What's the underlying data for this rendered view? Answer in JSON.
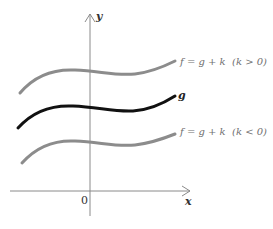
{
  "diagram": {
    "axes": {
      "x_label": "x",
      "y_label": "y",
      "origin_label": "0",
      "axis_color": "#8a8a8a"
    },
    "curves": [
      {
        "id": "upper",
        "label": "f = g + k  (k > 0)",
        "color": "#8c8c8c",
        "description": "g shifted up by k"
      },
      {
        "id": "base",
        "label": "g",
        "color": "#111111",
        "description": "original function g"
      },
      {
        "id": "lower",
        "label": "f = g + k  (k < 0)",
        "color": "#8c8c8c",
        "description": "g shifted down by k"
      }
    ]
  }
}
